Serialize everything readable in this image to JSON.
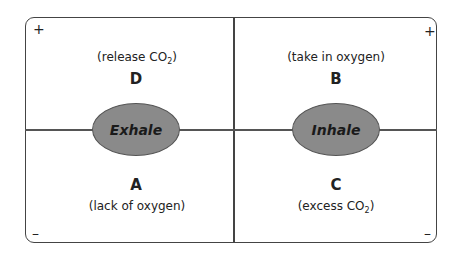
{
  "diagram": {
    "quadrants": {
      "top_left": {
        "label": "D",
        "description_prefix": "(release CO",
        "description_sub": "2",
        "description_suffix": ")"
      },
      "top_right": {
        "label": "B",
        "description": "(take in oxygen)"
      },
      "bottom_left": {
        "label": "A",
        "description": "(lack of oxygen)"
      },
      "bottom_right": {
        "label": "C",
        "description_prefix": "(excess CO",
        "description_sub": "2",
        "description_suffix": ")"
      }
    },
    "ovals": {
      "left": "Exhale",
      "right": "Inhale"
    },
    "signs": {
      "top_left": "+",
      "top_right": "+",
      "bottom_left": "–",
      "bottom_right": "–"
    },
    "colors": {
      "oval_fill": "#8a8a8a",
      "line": "#444444"
    }
  }
}
